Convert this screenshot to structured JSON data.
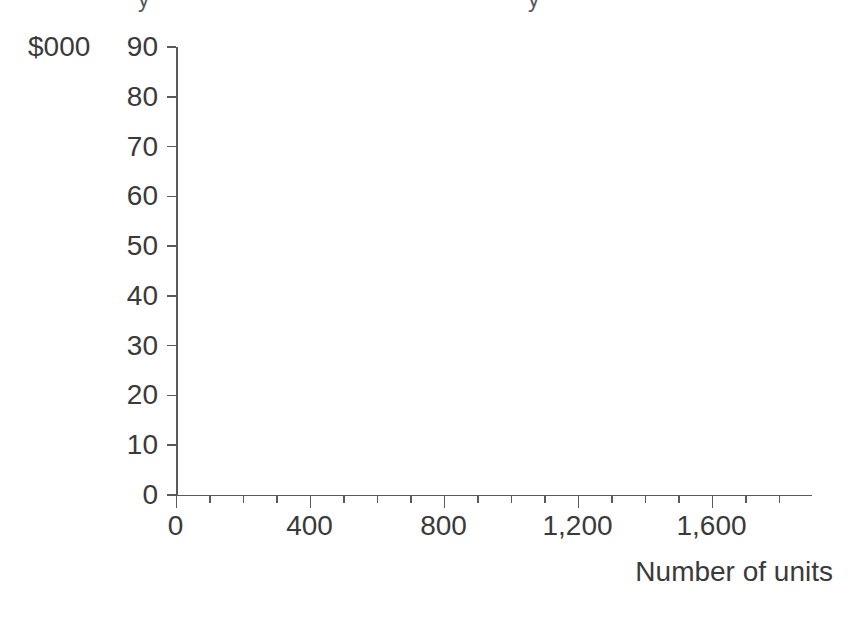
{
  "chart_data": {
    "type": "scatter",
    "title": "",
    "title_remnants": [
      "y",
      "y"
    ],
    "xlabel": "Number of units",
    "ylabel": "$000",
    "xlim": [
      0,
      1900
    ],
    "ylim": [
      0,
      90
    ],
    "grid": false,
    "legend": null,
    "series": [],
    "values": [],
    "x": [],
    "note": "Blank plotting grid - axes only, no data plotted",
    "y_axis": {
      "label": "$000",
      "min": 0,
      "max": 90,
      "major_step": 10,
      "tick_labels": [
        "90",
        "80",
        "70",
        "60",
        "50",
        "40",
        "30",
        "20",
        "10",
        "0"
      ],
      "tick_values": [
        90,
        80,
        70,
        60,
        50,
        40,
        30,
        20,
        10,
        0
      ]
    },
    "x_axis": {
      "label": "Number of units",
      "min": 0,
      "max": 1900,
      "major_step": 400,
      "minor_step": 100,
      "tick_labels": [
        "0",
        "400",
        "800",
        "1,200",
        "1,600"
      ],
      "tick_values": [
        0,
        400,
        800,
        1200,
        1600
      ],
      "minor_tick_values": [
        100,
        200,
        300,
        500,
        600,
        700,
        900,
        1000,
        1100,
        1300,
        1400,
        1500,
        1700,
        1800
      ]
    },
    "colors": {
      "ink": "#3a3a3a",
      "axis": "#5a5a5a",
      "background": "#ffffff"
    }
  }
}
